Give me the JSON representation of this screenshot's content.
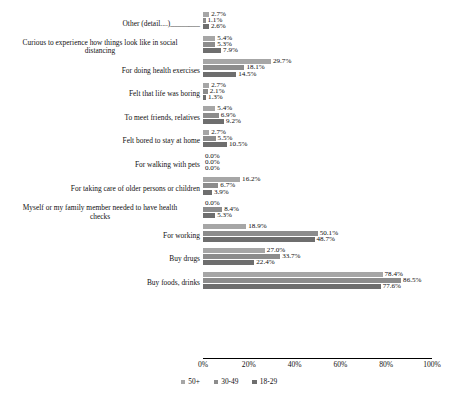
{
  "chart_data": {
    "type": "bar",
    "orientation": "horizontal",
    "title": "",
    "xlabel": "",
    "ylabel": "",
    "xlim": [
      0,
      100
    ],
    "xticks": [
      "0%",
      "20%",
      "40%",
      "60%",
      "80%",
      "100%"
    ],
    "xtick_values": [
      0,
      20,
      40,
      60,
      80,
      100
    ],
    "grid": false,
    "legend_position": "bottom",
    "value_suffix": "%",
    "categories": [
      "Other (detail....)________",
      "Curious to experience how things look like in social\ndistancing",
      "For doing health exercises",
      "Felt that life was boring",
      "To meet friends, relatives",
      "Felt bored to stay at home",
      "For walking with pets",
      "For taking care of older persons or children",
      "Myself or my family member needed to have health\nchecks",
      "For working",
      "Buy drugs",
      "Buy foods, drinks"
    ],
    "series": [
      {
        "name": "50+",
        "color": "#a6a6a6",
        "values": [
          2.7,
          5.4,
          29.7,
          2.7,
          5.4,
          2.7,
          0.0,
          16.2,
          0.0,
          18.9,
          27.0,
          78.4
        ],
        "labels": [
          "2.7%",
          "5.4%",
          "29.7%",
          "2.7%",
          "5.4%",
          "2.7%",
          "0.0%",
          "16.2%",
          "0.0%",
          "18.9%",
          "27.0%",
          "78.4%"
        ]
      },
      {
        "name": "30-49",
        "color": "#8c8c8c",
        "values": [
          1.1,
          5.3,
          18.1,
          2.1,
          6.9,
          5.5,
          0.0,
          6.7,
          8.4,
          50.1,
          33.7,
          86.5
        ],
        "labels": [
          "1.1%",
          "5.3%",
          "18.1%",
          "2.1%",
          "6.9%",
          "5.5%",
          "0.0%",
          "6.7%",
          "8.4%",
          "50.1%",
          "33.7%",
          "86.5%"
        ]
      },
      {
        "name": "18-29",
        "color": "#6e6e6e",
        "values": [
          2.6,
          7.9,
          14.5,
          1.3,
          9.2,
          10.5,
          0.0,
          3.9,
          5.3,
          48.7,
          22.4,
          77.6
        ],
        "labels": [
          "2.6%",
          "7.9%",
          "14.5%",
          "1.3%",
          "9.2%",
          "10.5%",
          "0.0%",
          "3.9%",
          "5.3%",
          "48.7%",
          "22.4%",
          "77.6%"
        ]
      }
    ],
    "legend": [
      {
        "label": "50+",
        "color": "#a6a6a6"
      },
      {
        "label": "30-49",
        "color": "#8c8c8c"
      },
      {
        "label": "18-29",
        "color": "#6e6e6e"
      }
    ]
  }
}
